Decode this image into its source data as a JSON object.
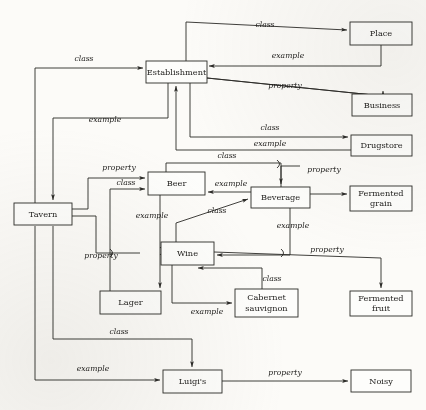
{
  "diagram": {
    "type": "node-link-diagram",
    "background_color": "#fcfbf8",
    "line_color": "#2b2a27",
    "nodes": [
      {
        "id": "establishment",
        "label": "Establishment",
        "x": 146,
        "y": 61,
        "w": 61,
        "h": 22
      },
      {
        "id": "place",
        "label": "Place",
        "x": 350,
        "y": 22,
        "w": 62,
        "h": 23
      },
      {
        "id": "business",
        "label": "Business",
        "x": 352,
        "y": 94,
        "w": 60,
        "h": 22
      },
      {
        "id": "drugstore",
        "label": "Drugstore",
        "x": 351,
        "y": 135,
        "w": 61,
        "h": 21
      },
      {
        "id": "tavern",
        "label": "Tavern",
        "x": 14,
        "y": 203,
        "w": 58,
        "h": 22
      },
      {
        "id": "beer",
        "label": "Beer",
        "x": 148,
        "y": 172,
        "w": 57,
        "h": 23
      },
      {
        "id": "beverage",
        "label": "Beverage",
        "x": 251,
        "y": 187,
        "w": 59,
        "h": 21
      },
      {
        "id": "fermentedgrain",
        "label": "Fermented grain",
        "x": 350,
        "y": 186,
        "w": 62,
        "h": 25
      },
      {
        "id": "wine",
        "label": "Wine",
        "x": 161,
        "y": 242,
        "w": 53,
        "h": 23
      },
      {
        "id": "lager",
        "label": "Lager",
        "x": 100,
        "y": 291,
        "w": 61,
        "h": 23
      },
      {
        "id": "cabernet",
        "label": "Cabernet sauvignon",
        "x": 235,
        "y": 289,
        "w": 63,
        "h": 28
      },
      {
        "id": "fermentedfruit",
        "label": "Fermented fruit",
        "x": 350,
        "y": 291,
        "w": 62,
        "h": 25
      },
      {
        "id": "luigis",
        "label": "Luigi's",
        "x": 163,
        "y": 370,
        "w": 59,
        "h": 23
      },
      {
        "id": "noisy",
        "label": "Noisy",
        "x": 351,
        "y": 370,
        "w": 60,
        "h": 22
      }
    ],
    "edges": [
      {
        "id": "e1",
        "from": "tavern",
        "to": "establishment",
        "label": "class",
        "label_x": 84,
        "label_y": 61
      },
      {
        "id": "e2",
        "from": "establishment",
        "to": "tavern",
        "label": "example",
        "label_x": 105,
        "label_y": 122
      },
      {
        "id": "e3",
        "from": "establishment",
        "to": "place",
        "label": "class",
        "label_x": 265,
        "label_y": 27
      },
      {
        "id": "e4",
        "from": "place",
        "to": "establishment",
        "label": "example",
        "label_x": 288,
        "label_y": 58
      },
      {
        "id": "e5",
        "from": "establishment",
        "to": "business",
        "label": "property",
        "label_x": 285,
        "label_y": 88
      },
      {
        "id": "e6",
        "from": "establishment",
        "to": "drugstore",
        "label": "class",
        "label_x": 270,
        "label_y": 130
      },
      {
        "id": "e7",
        "from": "drugstore",
        "to": "establishment",
        "label": "example",
        "label_x": 270,
        "label_y": 146
      },
      {
        "id": "e8",
        "from": "tavern",
        "to": "beer",
        "label": "property",
        "label_x": 119,
        "label_y": 170
      },
      {
        "id": "e9",
        "from": "tavern",
        "to": "beer",
        "label": "class",
        "label_x": 126,
        "label_y": 185
      },
      {
        "id": "e10",
        "from": "beer",
        "to": "beverage",
        "label": "class",
        "label_x": 227,
        "label_y": 158
      },
      {
        "id": "e11",
        "from": "beverage",
        "to": "beer",
        "label": "example",
        "label_x": 231,
        "label_y": 186
      },
      {
        "id": "e12",
        "from": "beverage",
        "to": "fermentedgrain",
        "label": "property",
        "label_x": 324,
        "label_y": 172
      },
      {
        "id": "e13",
        "from": "beer",
        "to": "lager",
        "label": "example",
        "label_x": 152,
        "label_y": 218
      },
      {
        "id": "e14",
        "from": "tavern",
        "to": "lager",
        "label": "property",
        "label_x": 101,
        "label_y": 258
      },
      {
        "id": "e15",
        "from": "wine",
        "to": "beverage",
        "label": "class",
        "label_x": 217,
        "label_y": 213
      },
      {
        "id": "e16",
        "from": "beverage",
        "to": "wine",
        "label": "example",
        "label_x": 293,
        "label_y": 228
      },
      {
        "id": "e17",
        "from": "wine",
        "to": "fermentedfruit",
        "label": "property",
        "label_x": 327,
        "label_y": 252
      },
      {
        "id": "e18",
        "from": "wine",
        "to": "cabernet",
        "label": "example",
        "label_x": 207,
        "label_y": 314
      },
      {
        "id": "e19",
        "from": "cabernet",
        "to": "wine",
        "label": "class",
        "label_x": 272,
        "label_y": 281
      },
      {
        "id": "e20",
        "from": "tavern",
        "to": "luigis",
        "label": "class",
        "label_x": 119,
        "label_y": 334
      },
      {
        "id": "e21",
        "from": "luigis",
        "to": "tavern",
        "label": "example",
        "label_x": 93,
        "label_y": 371
      },
      {
        "id": "e22",
        "from": "luigis",
        "to": "noisy",
        "label": "property",
        "label_x": 285,
        "label_y": 375
      }
    ]
  }
}
